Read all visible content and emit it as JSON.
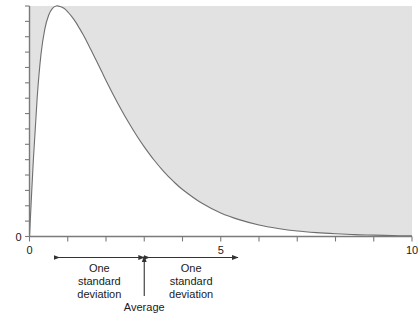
{
  "chart_data": {
    "type": "area",
    "title": "",
    "subtitle": "",
    "xlabel": "",
    "ylabel": "",
    "xlim": [
      0,
      10
    ],
    "ylim": [
      0,
      1.0
    ],
    "grid": false,
    "legend_position": "none",
    "fill_color": "#e2e2e2",
    "line_color": "#6e6e6e",
    "axis_color": "#7a7a7a",
    "text_color": "#1a1a1a",
    "shaded_region": "above-curve",
    "x_ticks": [
      0,
      1,
      2,
      3,
      4,
      5,
      6,
      7,
      8,
      9,
      10
    ],
    "x_tick_labels": [
      "0",
      "",
      "",
      "",
      "",
      "5",
      "",
      "",
      "",
      "",
      "10"
    ],
    "x_labeled_ticks": [
      {
        "value": 0,
        "label": "0"
      },
      {
        "value": 5,
        "label": "5"
      },
      {
        "value": 10,
        "label": "10"
      }
    ],
    "y_ticks": [
      0.0,
      0.0667,
      0.1333,
      0.2,
      0.2667,
      0.3333,
      0.4,
      0.4667,
      0.5333,
      0.6,
      0.6667,
      0.7333,
      0.8,
      0.8667,
      0.9333,
      1.0
    ],
    "y_tick_labels": [
      "0",
      "",
      "",
      "",
      "",
      "",
      "",
      "",
      "",
      "",
      "",
      "",
      "",
      "",
      "",
      ""
    ],
    "y_labeled_ticks": [
      {
        "value": 0,
        "label": "0"
      }
    ],
    "series": [
      {
        "name": "density",
        "x": [
          0.0,
          0.1,
          0.2,
          0.3,
          0.4,
          0.5,
          0.6,
          0.7,
          0.8,
          0.9,
          1.0,
          1.1,
          1.2,
          1.3,
          1.4,
          1.5,
          1.6,
          1.7,
          1.8,
          1.9,
          2.0,
          2.2,
          2.4,
          2.6,
          2.8,
          3.0,
          3.25,
          3.5,
          3.75,
          4.0,
          4.5,
          5.0,
          5.5,
          6.0,
          6.5,
          7.0,
          7.5,
          8.0,
          8.5,
          9.0,
          9.5,
          10.0
        ],
        "values": [
          0.0,
          0.33,
          0.6,
          0.79,
          0.9,
          0.96,
          0.99,
          1.0,
          0.998,
          0.99,
          0.975,
          0.955,
          0.932,
          0.905,
          0.876,
          0.845,
          0.812,
          0.779,
          0.745,
          0.711,
          0.677,
          0.612,
          0.55,
          0.492,
          0.438,
          0.389,
          0.333,
          0.284,
          0.241,
          0.204,
          0.145,
          0.102,
          0.072,
          0.05,
          0.035,
          0.024,
          0.017,
          0.012,
          0.008,
          0.006,
          0.004,
          0.003
        ]
      }
    ],
    "annotations": {
      "average": {
        "label": "Average",
        "x_value": 3.0
      },
      "left_interval": {
        "label_lines": [
          "One",
          "standard",
          "deviation"
        ],
        "from_x": 0.65,
        "to_x": 3.0,
        "arrow": "double-ended"
      },
      "right_interval": {
        "label_lines": [
          "One",
          "standard",
          "deviation"
        ],
        "from_x": 3.0,
        "to_x": 5.45,
        "arrow": "double-ended"
      }
    }
  }
}
